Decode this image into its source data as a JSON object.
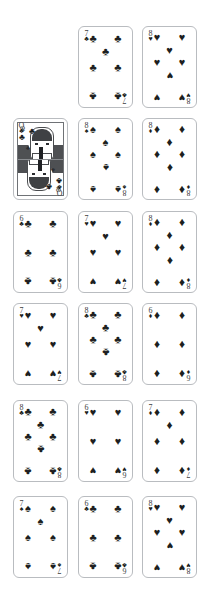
{
  "scene": {
    "background": "#ffffff",
    "card_border_color": "#b9bcc0",
    "pip_color": "#1d1f21",
    "index_color": "#3b3d40",
    "columns": 3,
    "rows": 6,
    "card_width": 55,
    "card_height": 82
  },
  "suit_glyphs": {
    "clubs": "♣",
    "spades": "♠",
    "hearts": "♥",
    "diamonds": "♦"
  },
  "layout": {
    "rows": [
      {
        "row": 1,
        "cards": [
          {
            "present": false
          },
          {
            "present": true,
            "rank": "7",
            "suit": "clubs",
            "suit_name": "Clubs",
            "label": "7 of Clubs",
            "pip_pattern": "2-1-2-2",
            "pip_count": 7
          },
          {
            "present": true,
            "rank": "8",
            "suit": "hearts",
            "suit_name": "Hearts",
            "label": "8 of Hearts",
            "pip_pattern": "2-1-2-1-2",
            "pip_count": 8
          }
        ]
      },
      {
        "row": 2,
        "cards": [
          {
            "present": true,
            "rank": "Q",
            "suit": "clubs",
            "suit_name": "Clubs",
            "label": "Queen of Clubs",
            "court": true
          },
          {
            "present": true,
            "rank": "8",
            "suit": "spades",
            "suit_name": "Spades",
            "label": "8 of Spades",
            "pip_pattern": "2-1-2-1-2",
            "pip_count": 8
          },
          {
            "present": true,
            "rank": "8",
            "suit": "diamonds",
            "suit_name": "Diamonds",
            "label": "8 of Diamonds",
            "pip_pattern": "2-1-2-1-2",
            "pip_count": 8
          }
        ]
      },
      {
        "row": 3,
        "cards": [
          {
            "present": true,
            "rank": "6",
            "suit": "clubs",
            "suit_name": "Clubs",
            "label": "6 of Clubs",
            "pip_pattern": "2-2-2",
            "pip_count": 6
          },
          {
            "present": true,
            "rank": "7",
            "suit": "hearts",
            "suit_name": "Hearts",
            "label": "7 of Hearts",
            "pip_pattern": "2-1-2-2",
            "pip_count": 7
          },
          {
            "present": true,
            "rank": "8",
            "suit": "diamonds",
            "suit_name": "Diamonds",
            "label": "8 of Diamonds",
            "pip_pattern": "2-1-2-1-2",
            "pip_count": 8
          }
        ]
      },
      {
        "row": 4,
        "cards": [
          {
            "present": true,
            "rank": "7",
            "suit": "hearts",
            "suit_name": "Hearts",
            "label": "7 of Hearts",
            "pip_pattern": "2-1-2-2",
            "pip_count": 7
          },
          {
            "present": true,
            "rank": "8",
            "suit": "clubs",
            "suit_name": "Clubs",
            "label": "8 of Clubs",
            "pip_pattern": "2-1-2-1-2",
            "pip_count": 8
          },
          {
            "present": true,
            "rank": "6",
            "suit": "diamonds",
            "suit_name": "Diamonds",
            "label": "6 of Diamonds",
            "pip_pattern": "2-2-2",
            "pip_count": 6
          }
        ]
      },
      {
        "row": 5,
        "cards": [
          {
            "present": true,
            "rank": "8",
            "suit": "clubs",
            "suit_name": "Clubs",
            "label": "8 of Clubs",
            "pip_pattern": "2-1-2-1-2",
            "pip_count": 8
          },
          {
            "present": true,
            "rank": "6",
            "suit": "hearts",
            "suit_name": "Hearts",
            "label": "6 of Hearts",
            "pip_pattern": "2-2-2",
            "pip_count": 6
          },
          {
            "present": true,
            "rank": "7",
            "suit": "diamonds",
            "suit_name": "Diamonds",
            "label": "7 of Diamonds",
            "pip_pattern": "2-1-2-2",
            "pip_count": 7
          }
        ]
      },
      {
        "row": 6,
        "cards": [
          {
            "present": true,
            "rank": "7",
            "suit": "spades",
            "suit_name": "Spades",
            "label": "7 of Spades",
            "pip_pattern": "2-1-2-2",
            "pip_count": 7
          },
          {
            "present": true,
            "rank": "6",
            "suit": "clubs",
            "suit_name": "Clubs",
            "label": "6 of Clubs",
            "pip_pattern": "2-2-2",
            "pip_count": 6
          },
          {
            "present": true,
            "rank": "8",
            "suit": "hearts",
            "suit_name": "Hearts",
            "label": "8 of Hearts",
            "pip_pattern": "2-1-2-1-2",
            "pip_count": 8
          }
        ]
      }
    ]
  },
  "court_card": {
    "rank": "Q",
    "suit": "clubs",
    "label": "Queen of Clubs",
    "corner_rank": "Q"
  }
}
